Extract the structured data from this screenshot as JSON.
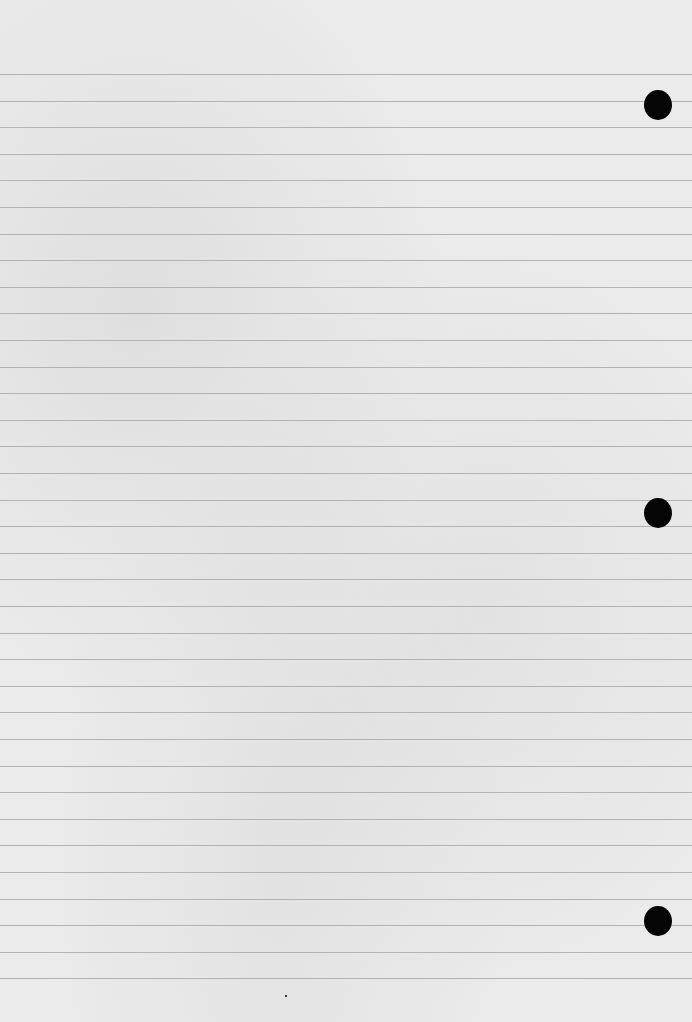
{
  "page": {
    "type": "blank ruled notebook paper",
    "background_color": "#ebebeb",
    "rule_color": "#a9a9a9",
    "rules": {
      "count": 35,
      "first_y": 74,
      "spacing": 26.6
    },
    "punch_holes": [
      {
        "cx": 658,
        "cy": 105
      },
      {
        "cx": 658,
        "cy": 513
      },
      {
        "cx": 658,
        "cy": 921
      }
    ],
    "hole_color": "#050505"
  }
}
